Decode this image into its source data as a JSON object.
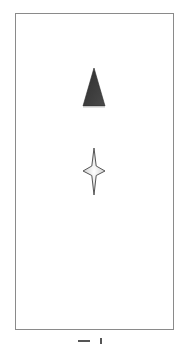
{
  "figure": {
    "frame": {
      "border_color": "#8a8a8a",
      "background": "#ffffff"
    },
    "shapes": [
      {
        "kind": "triangle",
        "name": "filled-triangle",
        "fill": "#3a3a3a",
        "label": ""
      },
      {
        "kind": "four-pointed-star",
        "name": "four-pointed-star",
        "fill": "#e6e6e6",
        "stroke": "#555555",
        "label": ""
      }
    ],
    "caption": {
      "text": "",
      "note": "partially cropped at bottom edge"
    }
  }
}
